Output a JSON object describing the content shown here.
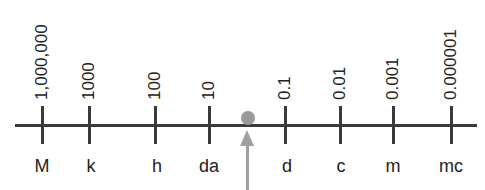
{
  "diagram": {
    "type": "number-line",
    "ticks": [
      {
        "value": "1,000,000",
        "prefix": "M",
        "x": 42
      },
      {
        "value": "1000",
        "prefix": "k",
        "x": 89
      },
      {
        "value": "100",
        "prefix": "h",
        "x": 155
      },
      {
        "value": "10",
        "prefix": "da",
        "x": 209
      },
      {
        "value": "0.1",
        "prefix": "d",
        "x": 285
      },
      {
        "value": "0.01",
        "prefix": "c",
        "x": 340
      },
      {
        "value": "0.001",
        "prefix": "m",
        "x": 393
      },
      {
        "value": "0.000001",
        "prefix": "mc",
        "x": 451
      }
    ],
    "base_marker": {
      "x": 248,
      "color": "#999999"
    },
    "arrow_color": "#a0a0a0",
    "line_color": "#3a3a3a"
  }
}
